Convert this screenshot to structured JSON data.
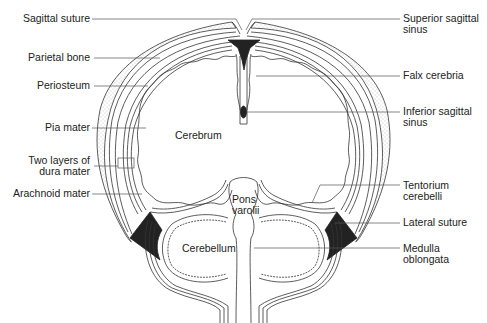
{
  "diagram": {
    "type": "anatomical-cross-section",
    "left_labels": [
      {
        "id": "sagittal-suture",
        "text": "Sagittal suture"
      },
      {
        "id": "parietal-bone",
        "text": "Parietal bone"
      },
      {
        "id": "periosteum",
        "text": "Periosteum"
      },
      {
        "id": "pia-mater",
        "text": "Pia mater"
      },
      {
        "id": "dura-mater",
        "line1": "Two layers of",
        "line2": "dura mater"
      },
      {
        "id": "arachnoid-mater",
        "text": "Arachnoid mater"
      }
    ],
    "right_labels": [
      {
        "id": "superior-sagittal-sinus",
        "line1": "Superior sagittal",
        "line2": "sinus"
      },
      {
        "id": "falx-cerebria",
        "text": "Falx cerebria"
      },
      {
        "id": "inferior-sagittal-sinus",
        "line1": "Inferior sagittal",
        "line2": "sinus"
      },
      {
        "id": "tentorium-cerebelli",
        "line1": "Tentorium",
        "line2": "cerebelli"
      },
      {
        "id": "lateral-suture",
        "text": "Lateral suture"
      },
      {
        "id": "medulla-oblongata",
        "line1": "Medulla",
        "line2": "oblongata"
      }
    ],
    "inner_labels": {
      "cerebrum": "Cerebrum",
      "pons_line1": "Pons",
      "pons_line2": "varolii",
      "cerebellum": "Cerebellum"
    },
    "colors": {
      "line": "#333333",
      "sinus_fill": "#222222",
      "bone_dots": "#888888",
      "background": "#ffffff"
    }
  }
}
